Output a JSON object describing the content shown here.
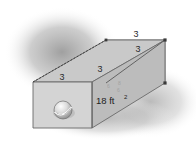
{
  "figure": {
    "colors": {
      "shadow": "#9a9a9a",
      "face_front_left": "#d2d2d2",
      "face_top": "#c9c9c9",
      "face_front_right": "#bdbdbd",
      "face_right_end": "#fbfbfb",
      "outline": "#6a6a6a",
      "dashed_edge": "#4a4a4a",
      "sphere_light": "#f0f0f0",
      "sphere_dark": "#7c7c7c",
      "label_text": "#2b2b2b",
      "background": "#ffffff"
    },
    "labels": {
      "top_left_edge": "3",
      "top_mid_edge": "3",
      "top_right_edge": "3",
      "right_face_diagonal": "3",
      "area": "18 ft",
      "area_exponent": "2",
      "faint_mark_1": "6",
      "faint_mark_2": "8",
      "faint_mark_3": "6"
    },
    "geometry": {
      "front_left_face": "33,82 92,82 92,128 33,128",
      "top_face": "33,82 92,82 165,40 106,40",
      "front_right_face": "92,82 165,40 165,83 92,128",
      "right_end_face": "106,40 165,40 165,83 106,83",
      "diagonal_right_face": "106,83 165,40",
      "dashed_top_edge": "33,82 106,40",
      "sphere_center_x": 63,
      "sphere_center_y": 110,
      "sphere_rx": 10,
      "sphere_ry": 8
    }
  }
}
